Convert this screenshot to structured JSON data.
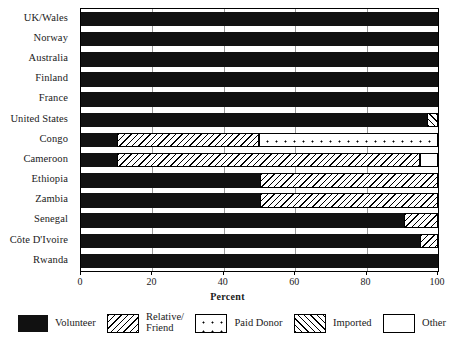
{
  "chart_data": {
    "type": "bar",
    "orientation": "horizontal",
    "stacked": true,
    "title": "",
    "xlabel": "Percent",
    "ylabel": "",
    "xlim": [
      0,
      100
    ],
    "xticks": [
      0,
      20,
      40,
      60,
      80,
      100
    ],
    "grid": true,
    "grid_axis": "x",
    "legend_position": "bottom",
    "categories": [
      "UK/Wales",
      "Norway",
      "Australia",
      "Finland",
      "France",
      "United States",
      "Congo",
      "Cameroon",
      "Ethiopia",
      "Zambia",
      "Senegal",
      "Côte D'Ivoire",
      "Rwanda"
    ],
    "series": [
      {
        "name": "Volunteer",
        "fill": "volunteer",
        "color": "#111111",
        "values": [
          100,
          100,
          100,
          100,
          100,
          97,
          10,
          10,
          50,
          50,
          90.5,
          95,
          100
        ]
      },
      {
        "name": "Relative/\nFriend",
        "fill": "relative",
        "color": "#ffffff",
        "values": [
          0,
          0,
          0,
          0,
          0,
          0,
          40,
          85,
          50,
          50,
          9.5,
          5,
          0
        ]
      },
      {
        "name": "Paid Donor",
        "fill": "paid",
        "color": "#ffffff",
        "values": [
          0,
          0,
          0,
          0,
          0,
          0,
          50,
          0,
          0,
          0,
          0,
          0,
          0
        ]
      },
      {
        "name": "Imported",
        "fill": "imported",
        "color": "#ffffff",
        "values": [
          0,
          0,
          0,
          0,
          0,
          3,
          0,
          0,
          0,
          0,
          0,
          0,
          0
        ]
      },
      {
        "name": "Other",
        "fill": "other",
        "color": "#ffffff",
        "values": [
          0,
          0,
          0,
          0,
          0,
          0,
          0,
          5,
          0,
          0,
          0,
          0,
          0
        ]
      }
    ]
  },
  "legend": {
    "items": [
      {
        "label": "Volunteer",
        "fill": "volunteer"
      },
      {
        "label": "Relative/\nFriend",
        "fill": "relative"
      },
      {
        "label": "Paid Donor",
        "fill": "paid"
      },
      {
        "label": "Imported",
        "fill": "imported"
      },
      {
        "label": "Other",
        "fill": "other"
      }
    ]
  }
}
